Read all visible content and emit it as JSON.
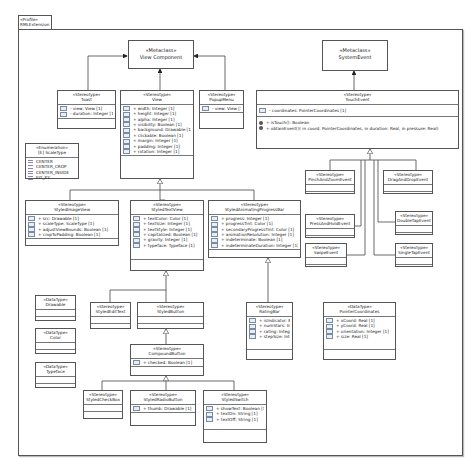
{
  "profile": {
    "stereotype": "«Profile»",
    "name": "RMLExtension"
  },
  "metaclasses": {
    "view_component": {
      "stereotype": "«Metaclass»",
      "name": "View Component"
    },
    "system_event": {
      "stereotype": "«Metaclass»",
      "name": "SystemEvent"
    }
  },
  "stereotypes": {
    "toast": {
      "stereotype": "«Stereotype»",
      "name": "Toast",
      "attributes": [
        "- view: View [1]",
        "- duration: Integer [1]"
      ]
    },
    "view": {
      "stereotype": "«Stereotype»",
      "name": "View",
      "attributes": [
        "+ width: Integer [1]",
        "+ height: Integer [1]",
        "+ alpha: Integer [1]",
        "+ visibility: Boolean [1]",
        "+ background: Drawable [1]",
        "+ clickable: Boolean [1]",
        "+ margin: Integer [1]",
        "+ padding: Integer [1]",
        "+ rotation: Integer [1]"
      ]
    },
    "popup_menu": {
      "stereotype": "«Stereotype»",
      "name": "PopupMenu",
      "attributes": [
        "- view: View [1]"
      ]
    },
    "touch_event": {
      "stereotype": "«Stereotype»",
      "name": "TouchEvent",
      "attributes": [
        "- coordinates: PointerCoordinates [1]"
      ],
      "operations": [
        "+ isTouch(): Boolean",
        "+ obtainEvent()( in coord: PointerCoordinates,  in duration: Real,  in pressure: Real)"
      ]
    },
    "styled_image_view": {
      "stereotype": "«Stereotype»",
      "name": "StyledImageView",
      "attributes": [
        "+ src: Drawable [1]",
        "+ scaleType: ScaleType [1]",
        "+ adjustViewBounds: Boolean [1]",
        "+ cropToPadding: Boolean [1]"
      ]
    },
    "styled_text_view": {
      "stereotype": "«Stereotype»",
      "name": "StyledTextView",
      "attributes": [
        "+ textColor: Color [1]",
        "+ textSize: Integer [1]",
        "+ textStyle: Integer [1]",
        "+ capitalized: Boolean [1]",
        "+ gravity: Integer [1]",
        "+ typeface: Typeface [1]"
      ]
    },
    "styled_progress_bar": {
      "stereotype": "«Stereotype»",
      "name": "StyledAnimatingProgressBar",
      "attributes": [
        "+ progress: Integer [1]",
        "+ progressTint: Color [1]",
        "+ secondaryProgressTint: Color [1]",
        "+ animationResolution: Integer [1]",
        "+ indeterminate: Boolean [1]",
        "+ indeterminateDuration: Integer [1]"
      ]
    },
    "pinch_zoom": {
      "stereotype": "«Stereotype»",
      "name": "PinchAndZoomEvent"
    },
    "drag_drop": {
      "stereotype": "«Stereotype»",
      "name": "DragAndDropEvent"
    },
    "press_hold": {
      "stereotype": "«Stereotype»",
      "name": "PressAndHoldEvent"
    },
    "double_tap": {
      "stereotype": "«Stereotype»",
      "name": "DoubleTapEvent"
    },
    "swipe": {
      "stereotype": "«Stereotype»",
      "name": "SwipeEvent"
    },
    "single_tap": {
      "stereotype": "«Stereotype»",
      "name": "SingleTapEvent"
    },
    "styled_edit_text": {
      "stereotype": "«Stereotype»",
      "name": "StyledEditText"
    },
    "styled_button": {
      "stereotype": "«Stereotype»",
      "name": "StyledButton"
    },
    "rating_bar": {
      "stereotype": "«Stereotype»",
      "name": "RatingBar",
      "attributes": [
        "+ isIndicator: Boolean [1]",
        "+ numStars: Integer [1]",
        "+ rating: Integer [1]",
        "+ stepSize: Integer [1]"
      ]
    },
    "compound_button": {
      "stereotype": "«Stereotype»",
      "name": "CompoundButton",
      "attributes": [
        "+ checked: Boolean [1]"
      ]
    },
    "styled_check_box": {
      "stereotype": "«Stereotype»",
      "name": "StyledCheckBox"
    },
    "styled_radio_button": {
      "stereotype": "«Stereotype»",
      "name": "StyledRadioButton",
      "attributes": [
        "+ thumb: Drawable [1]"
      ]
    },
    "styled_switch": {
      "stereotype": "«Stereotype»",
      "name": "StyledSwitch",
      "attributes": [
        "+ showText: Boolean [1]",
        "+ textOn: String [1]",
        "+ textOff: String [1]"
      ]
    }
  },
  "enumeration": {
    "stereotype": "«Enumeration»",
    "name": "[E] ScaleType",
    "literals": [
      "CENTER",
      "CENTER_CROP",
      "CENTER_INSIDE",
      "FIT_XY"
    ]
  },
  "datatypes": {
    "drawable": {
      "stereotype": "«DataType»",
      "name": "Drawable"
    },
    "color": {
      "stereotype": "«DataType»",
      "name": "Color"
    },
    "typeface": {
      "stereotype": "«DataType»",
      "name": "Typeface"
    },
    "pointer_coordinates": {
      "stereotype": "«DataType»",
      "name": "PointerCoordinates",
      "attributes": [
        "+ xCoord: Real [1]",
        "+ yCoord: Real [1]",
        "+ orientation: Integer [1]",
        "+ size: Real [1]"
      ]
    }
  }
}
